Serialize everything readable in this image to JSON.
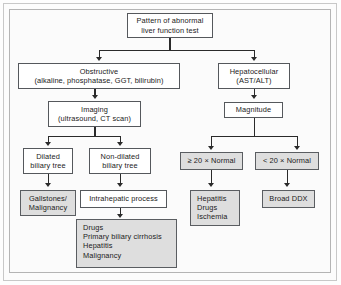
{
  "diagram": {
    "title": "Pattern of abnormal liver function test",
    "nodes": {
      "root": {
        "line1": "Pattern of abnormal",
        "line2": "liver function test"
      },
      "obstructive": {
        "line1": "Obstructive",
        "line2": "(alkaline, phosphatase, GGT, bilirubin)"
      },
      "hepatocellular": {
        "line1": "Hepatocellular",
        "line2": "(AST/ALT)"
      },
      "imaging": {
        "line1": "Imaging",
        "line2": "(ultrasound, CT scan)"
      },
      "magnitude": {
        "line1": "Magnitude"
      },
      "dilated": {
        "line1": "Dilated",
        "line2": "biliary tree"
      },
      "non_dilated": {
        "line1": "Non-dilated",
        "line2": "biliary tree"
      },
      "ge20": {
        "line1": "≥ 20 × Normal"
      },
      "lt20": {
        "line1": "< 20 × Normal"
      },
      "gallstones": {
        "line1": "Gallstones/",
        "line2": "Malignancy"
      },
      "intrahepatic": {
        "line1": "Intrahepatic process"
      },
      "intrahepatic_list": {
        "line1": "Drugs",
        "line2": "Primary biliary cirrhosis",
        "line3": "Hepatitis",
        "line4": "Malignancy"
      },
      "hepatitis_list": {
        "line1": "Hepatitis",
        "line2": "Drugs",
        "line3": "Ischemia"
      },
      "broad_ddx": {
        "line1": "Broad DDX"
      }
    },
    "colors": {
      "box_border": "#55585c",
      "box_fill": "#ffffff",
      "highlight_fill": "#dedede",
      "connector": "#2a2a2a",
      "frame": "#c8c8c8",
      "background": "#fbfbfb"
    }
  }
}
